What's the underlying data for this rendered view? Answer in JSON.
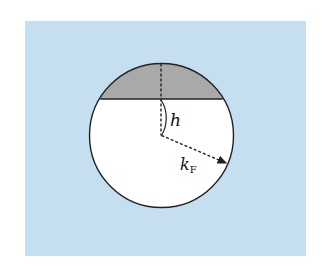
{
  "diagram": {
    "background_color": "#c5dff1",
    "circle": {
      "cx": 161.5,
      "cy": 135.5,
      "r": 72,
      "fill": "#ffffff",
      "stroke": "#222222"
    },
    "cap": {
      "chord_y": 99,
      "fill": "#a9a9a9"
    },
    "labels": {
      "h": "h",
      "kF_main": "k",
      "kF_sub": "F"
    }
  }
}
